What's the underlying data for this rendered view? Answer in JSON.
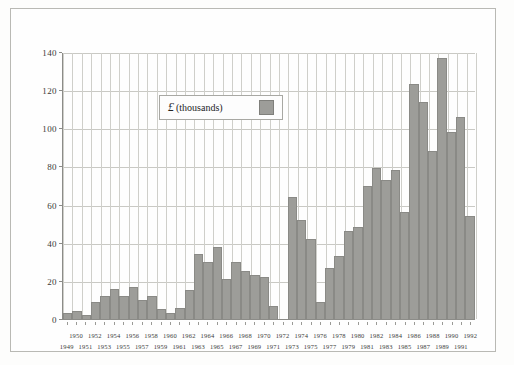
{
  "figure": {
    "background_color": "#fdfdfc",
    "frame_color": "#b9b9b4",
    "bar_color": "#9d9d99",
    "bar_edge_color": "#8a8a86",
    "grid_color": "#c9c9c4",
    "axis_color": "#8c8c88"
  },
  "legend": {
    "currency_symbol": "£",
    "unit_label": "(thousands)",
    "swatch_color": "#9d9d99",
    "position": "upper-left-inside"
  },
  "chart_data": {
    "type": "bar",
    "title": "",
    "subtitle": "",
    "xlabel": "",
    "ylabel": "",
    "ylim": [
      0,
      140
    ],
    "yticks": [
      0,
      20,
      40,
      60,
      80,
      100,
      120,
      140
    ],
    "ytick_labels": [
      "0",
      "20",
      "40",
      "60",
      "80",
      "100",
      "120",
      "140"
    ],
    "grid": true,
    "legend_entries": [
      "£ (thousands)"
    ],
    "categories": [
      "1949",
      "1950",
      "1951",
      "1952",
      "1953",
      "1954",
      "1955",
      "1956",
      "1957",
      "1958",
      "1959",
      "1960",
      "1961",
      "1962",
      "1963",
      "1964",
      "1965",
      "1966",
      "1967",
      "1968",
      "1969",
      "1970",
      "1971",
      "1972",
      "1973",
      "1974",
      "1975",
      "1976",
      "1977",
      "1978",
      "1979",
      "1980",
      "1981",
      "1982",
      "1983",
      "1984",
      "1985",
      "1986",
      "1987",
      "1988",
      "1989",
      "1990",
      "1991",
      "1992"
    ],
    "x_labels_upper": [
      "1950",
      "1952",
      "1954",
      "1956",
      "1958",
      "1960",
      "1962",
      "1964",
      "1966",
      "1968",
      "1970",
      "1972",
      "1974",
      "1976",
      "1978",
      "1980",
      "1982",
      "1984",
      "1986",
      "1988",
      "1990",
      "1992"
    ],
    "x_labels_lower": [
      "1949",
      "1951",
      "1953",
      "1955",
      "1957",
      "1959",
      "1961",
      "1963",
      "1965",
      "1967",
      "1969",
      "1971",
      "1973",
      "1975",
      "1977",
      "1979",
      "1981",
      "1983",
      "1985",
      "1987",
      "1989",
      "1991"
    ],
    "values": [
      3,
      4,
      2,
      9,
      12,
      16,
      12,
      17,
      10,
      12,
      5,
      3,
      6,
      15,
      34,
      30,
      38,
      21,
      30,
      25,
      23,
      22,
      7,
      0,
      64,
      52,
      42,
      9,
      27,
      33,
      46,
      48,
      70,
      79,
      73,
      78,
      56,
      123,
      114,
      88,
      137,
      98,
      106,
      54
    ],
    "value_unit": "thousands of pounds"
  }
}
